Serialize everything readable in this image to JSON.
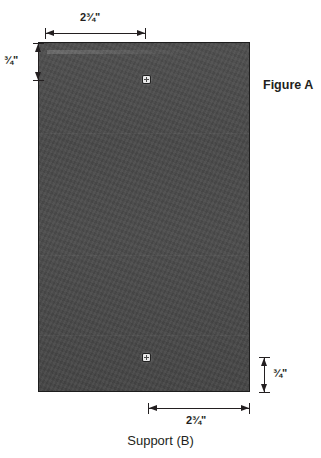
{
  "figure": {
    "label": "Figure A",
    "caption": "Support (B)"
  },
  "part": {
    "name": "Support (B)",
    "material_color": "#4a4a4a",
    "outline_color": "#1d1d1d"
  },
  "dimensions": [
    {
      "id": "top-width",
      "value": "2¾\"",
      "orientation": "horizontal",
      "position": "top",
      "measures": "width-of-upper-segment"
    },
    {
      "id": "left-height",
      "value": "¾\"",
      "orientation": "vertical",
      "position": "left",
      "measures": "offset-to-upper-fastener"
    },
    {
      "id": "right-height",
      "value": "¾\"",
      "orientation": "vertical",
      "position": "right",
      "measures": "offset-to-lower-fastener"
    },
    {
      "id": "bottom-width",
      "value": "2¾\"",
      "orientation": "horizontal",
      "position": "bottom",
      "measures": "width-of-lower-segment"
    }
  ],
  "fasteners": [
    {
      "id": "screw-top",
      "x_pct": 51,
      "y_pct": 10.5
    },
    {
      "id": "screw-bottom",
      "x_pct": 51,
      "y_pct": 90.5
    }
  ],
  "colors": {
    "ink": "#231f20",
    "panel": "#4a4a4a",
    "background": "#ffffff"
  }
}
